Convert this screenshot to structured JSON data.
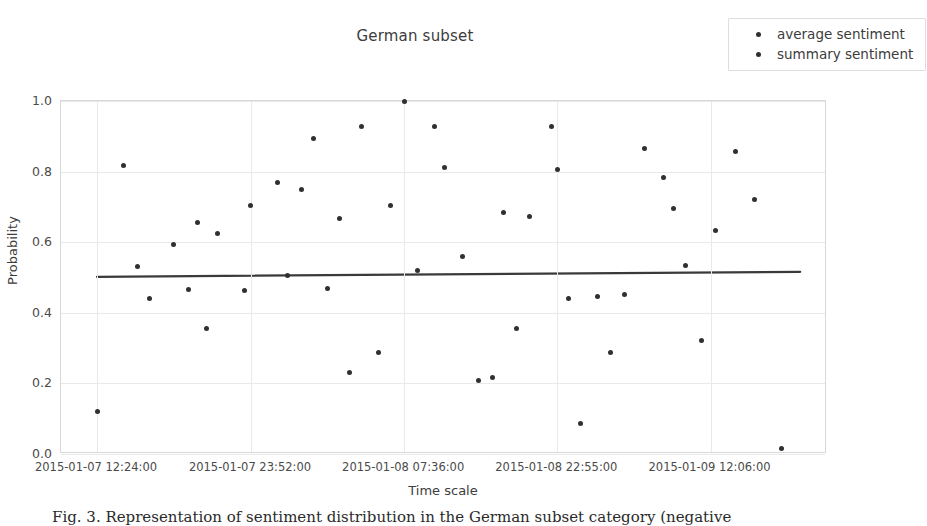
{
  "chart_data": {
    "type": "scatter",
    "title": "German subset",
    "xlabel": "Time scale",
    "ylabel": "Probability",
    "ylim": [
      0.0,
      1.0
    ],
    "yticks": [
      "0.0",
      "0.2",
      "0.4",
      "0.6",
      "0.8",
      "1.0"
    ],
    "ytick_values": [
      0.0,
      0.2,
      0.4,
      0.6,
      0.8,
      1.0
    ],
    "xticks": [
      "2015-01-07 12:24:00",
      "2015-01-07 23:52:00",
      "2015-01-08 07:36:00",
      "2015-01-08 22:55:00",
      "2015-01-09 12:06:00"
    ],
    "xtick_positions": [
      0.047,
      0.248,
      0.448,
      0.648,
      0.848
    ],
    "grid": true,
    "legend_position": "upper right",
    "legend": [
      {
        "label": "average sentiment",
        "color": "#2f3033",
        "marker": "dot"
      },
      {
        "label": "summary sentiment",
        "color": "#2f3033",
        "marker": "dot"
      }
    ],
    "series": [
      {
        "name": "average sentiment",
        "color": "#2f3033",
        "points": [
          {
            "x": 0.047,
            "y": 0.121
          },
          {
            "x": 0.082,
            "y": 0.818
          },
          {
            "x": 0.1,
            "y": 0.531
          },
          {
            "x": 0.116,
            "y": 0.44
          },
          {
            "x": 0.147,
            "y": 0.594
          },
          {
            "x": 0.166,
            "y": 0.465
          },
          {
            "x": 0.178,
            "y": 0.656
          },
          {
            "x": 0.19,
            "y": 0.355
          },
          {
            "x": 0.204,
            "y": 0.624
          },
          {
            "x": 0.24,
            "y": 0.463
          },
          {
            "x": 0.248,
            "y": 0.703
          },
          {
            "x": 0.282,
            "y": 0.768
          },
          {
            "x": 0.296,
            "y": 0.506
          },
          {
            "x": 0.314,
            "y": 0.749
          },
          {
            "x": 0.33,
            "y": 0.893
          },
          {
            "x": 0.348,
            "y": 0.47
          },
          {
            "x": 0.363,
            "y": 0.667
          },
          {
            "x": 0.376,
            "y": 0.231
          },
          {
            "x": 0.392,
            "y": 0.928
          },
          {
            "x": 0.415,
            "y": 0.288
          },
          {
            "x": 0.43,
            "y": 0.703
          },
          {
            "x": 0.448,
            "y": 1.0
          },
          {
            "x": 0.466,
            "y": 0.52
          },
          {
            "x": 0.488,
            "y": 0.928
          },
          {
            "x": 0.5,
            "y": 0.813
          },
          {
            "x": 0.524,
            "y": 0.559
          },
          {
            "x": 0.545,
            "y": 0.209
          },
          {
            "x": 0.563,
            "y": 0.218
          },
          {
            "x": 0.578,
            "y": 0.685
          },
          {
            "x": 0.595,
            "y": 0.356
          },
          {
            "x": 0.612,
            "y": 0.673
          },
          {
            "x": 0.64,
            "y": 0.928
          },
          {
            "x": 0.648,
            "y": 0.806
          },
          {
            "x": 0.662,
            "y": 0.44
          },
          {
            "x": 0.678,
            "y": 0.086
          },
          {
            "x": 0.7,
            "y": 0.445
          },
          {
            "x": 0.718,
            "y": 0.288
          },
          {
            "x": 0.735,
            "y": 0.452
          },
          {
            "x": 0.762,
            "y": 0.866
          },
          {
            "x": 0.786,
            "y": 0.783
          },
          {
            "x": 0.8,
            "y": 0.695
          },
          {
            "x": 0.815,
            "y": 0.533
          },
          {
            "x": 0.836,
            "y": 0.321
          },
          {
            "x": 0.855,
            "y": 0.632
          },
          {
            "x": 0.88,
            "y": 0.856
          },
          {
            "x": 0.905,
            "y": 0.721
          },
          {
            "x": 0.94,
            "y": 0.016
          }
        ]
      }
    ],
    "trendline": {
      "name": "fit",
      "color": "#3a3a3a",
      "x0": 0.047,
      "y0": 0.502,
      "x1": 0.965,
      "y1": 0.516
    }
  },
  "caption": {
    "text": "Fig. 3. Representation of sentiment distribution in the German subset category (negative"
  }
}
